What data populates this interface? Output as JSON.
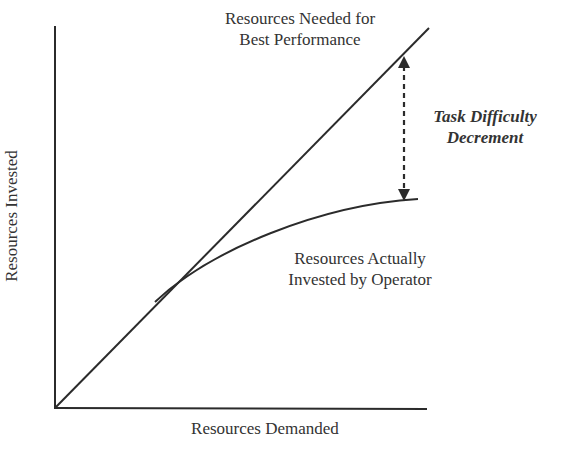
{
  "figure": {
    "y_axis_label": "Resources Invested",
    "x_axis_label": "Resources Demanded",
    "line_label": [
      "Resources Needed for",
      "Best Performance"
    ],
    "curve_label": [
      "Resources Actually",
      "Invested by Operator"
    ],
    "gap_label": [
      "Task Difficulty",
      "Decrement"
    ]
  },
  "colors": {
    "line": "#2b2b2b",
    "text": "#333333"
  }
}
